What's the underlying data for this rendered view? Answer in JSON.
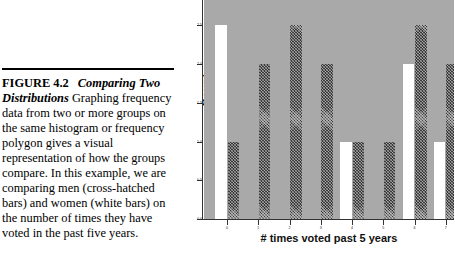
{
  "figure": {
    "number_label": "FIGURE 4.2",
    "title": "Comparing Two Distributions",
    "body": "Graphing frequency data from two or more groups on the same histogram or frequency polygon gives a visual representation of how the groups compare. In this example, we are comparing men (cross-hatched bars) and women (white bars) on the number of times they have voted in the past five years."
  },
  "chart_data": {
    "type": "bar",
    "title": "",
    "xlabel": "# times voted past 5 years",
    "ylabel": "Count",
    "categories": [
      "0",
      "1",
      "2",
      "3",
      "4",
      "5",
      "6",
      "7"
    ],
    "ylim": [
      0.0,
      2.75
    ],
    "yticks": [
      0.0,
      0.5,
      1.0,
      1.5,
      2.0,
      2.5
    ],
    "ytick_labels": [
      "0.0",
      "0.5",
      "1.0",
      "1.5",
      "2.0",
      "2.5"
    ],
    "grid": false,
    "legend": "none",
    "plot_background": "#a9a9a9",
    "series": [
      {
        "name": "women (white bars)",
        "fill": "white",
        "color": "#ffffff",
        "values": [
          2.5,
          0,
          0,
          0,
          1.0,
          0,
          2.0,
          1.0
        ]
      },
      {
        "name": "men (cross-hatched bars)",
        "fill": "cross-hatched",
        "color": "#3a3a3a",
        "values": [
          1.0,
          2.0,
          2.5,
          2.0,
          1.0,
          1.0,
          2.5,
          2.0
        ]
      }
    ]
  }
}
